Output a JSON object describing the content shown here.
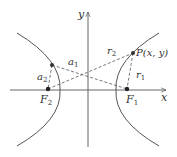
{
  "diagram": {
    "type": "hyperbola",
    "axes": {
      "x_label": "x",
      "y_label": "y"
    },
    "points": {
      "P": {
        "label": "P(x, y)"
      },
      "F1": {
        "base": "F",
        "sub": "1"
      },
      "F2": {
        "base": "F",
        "sub": "2"
      }
    },
    "segments": {
      "r1": {
        "base": "r",
        "sub": "1"
      },
      "r2": {
        "base": "r",
        "sub": "2"
      },
      "a1": {
        "base": "a",
        "sub": "1"
      },
      "a2": {
        "base": "a",
        "sub": "2"
      }
    },
    "colors": {
      "curve": "#555555",
      "axis": "#555555",
      "dash": "#555555",
      "text": "#333333"
    }
  }
}
